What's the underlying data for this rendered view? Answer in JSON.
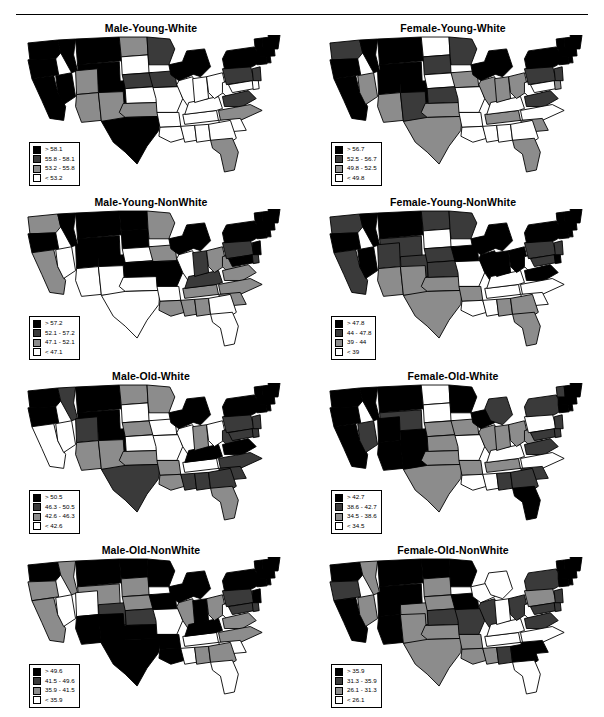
{
  "figure": {
    "has_top_rule": true,
    "panel_count": 8,
    "bin_colors": [
      "#000000",
      "#3a3a3a",
      "#8c8c8c",
      "#ffffff"
    ]
  },
  "chart_data": {
    "type": "map",
    "title": "",
    "subtitle": "",
    "legend_position": "bottom-left inside each panel",
    "class_colors": [
      "#000000",
      "#3a3a3a",
      "#8c8c8c",
      "#ffffff"
    ],
    "panels": [
      {
        "title": "Male-Young-White",
        "legend": [
          {
            "swatch": "#000000",
            "label": "> 58.1"
          },
          {
            "swatch": "#3a3a3a",
            "label": "55.8 - 58.1"
          },
          {
            "swatch": "#8c8c8c",
            "label": "53.2 - 55.8"
          },
          {
            "swatch": "#ffffff",
            "label": "< 53.2"
          }
        ],
        "breaks": [
          53.2,
          55.8,
          58.1
        ],
        "state_classes": {
          "WA": 0,
          "OR": 0,
          "CA": 0,
          "NV": 0,
          "ID": 0,
          "MT": 0,
          "WY": 0,
          "UT": 2,
          "AZ": 2,
          "CO": 0,
          "NM": 2,
          "ND": 2,
          "SD": 3,
          "NE": 1,
          "KS": 3,
          "OK": 2,
          "TX": 0,
          "MN": 1,
          "IA": 1,
          "MO": 3,
          "AR": 3,
          "LA": 3,
          "WI": 0,
          "IL": 3,
          "MS": 3,
          "AL": 3,
          "TN": 3,
          "KY": 3,
          "IN": 3,
          "MI": 0,
          "OH": 3,
          "WV": 3,
          "VA": 1,
          "NC": 2,
          "SC": 3,
          "GA": 3,
          "FL": 2,
          "PA": 1,
          "NY": 0,
          "MD": 3,
          "DE": 3,
          "NJ": 1,
          "CT": 0,
          "RI": 0,
          "MA": 0,
          "VT": 0,
          "NH": 0,
          "ME": 0
        }
      },
      {
        "title": "Female-Young-White",
        "legend": [
          {
            "swatch": "#000000",
            "label": "> 56.7"
          },
          {
            "swatch": "#3a3a3a",
            "label": "52.5 - 56.7"
          },
          {
            "swatch": "#8c8c8c",
            "label": "49.8 - 52.5"
          },
          {
            "swatch": "#ffffff",
            "label": "< 49.8"
          }
        ],
        "breaks": [
          49.8,
          52.5,
          56.7
        ],
        "state_classes": {
          "WA": 1,
          "OR": 0,
          "CA": 0,
          "NV": 2,
          "ID": 0,
          "MT": 0,
          "WY": 0,
          "UT": 0,
          "AZ": 2,
          "CO": 0,
          "NM": 1,
          "ND": 3,
          "SD": 1,
          "NE": 3,
          "KS": 1,
          "OK": 2,
          "TX": 2,
          "MN": 1,
          "IA": 2,
          "MO": 3,
          "AR": 3,
          "LA": 3,
          "WI": 0,
          "IL": 2,
          "MS": 3,
          "AL": 3,
          "TN": 2,
          "KY": 3,
          "IN": 2,
          "MI": 0,
          "OH": 2,
          "WV": 3,
          "VA": 1,
          "NC": 3,
          "SC": 2,
          "GA": 3,
          "FL": 2,
          "PA": 1,
          "NY": 0,
          "MD": 3,
          "DE": 2,
          "NJ": 1,
          "CT": 0,
          "RI": 0,
          "MA": 0,
          "VT": 0,
          "NH": 0,
          "ME": 0
        }
      },
      {
        "title": "Male-Young-NonWhite",
        "legend": [
          {
            "swatch": "#000000",
            "label": "> 57.2"
          },
          {
            "swatch": "#3a3a3a",
            "label": "52.1 - 57.2"
          },
          {
            "swatch": "#8c8c8c",
            "label": "47.1 - 52.1"
          },
          {
            "swatch": "#ffffff",
            "label": "< 47.1"
          }
        ],
        "breaks": [
          47.1,
          52.1,
          57.2
        ],
        "state_classes": {
          "WA": 2,
          "OR": 0,
          "CA": 2,
          "NV": 3,
          "ID": 0,
          "MT": 0,
          "WY": 0,
          "UT": 0,
          "AZ": 3,
          "CO": 0,
          "NM": 3,
          "ND": 0,
          "SD": 0,
          "NE": 3,
          "KS": 0,
          "OK": 3,
          "TX": 3,
          "MN": 2,
          "IA": 2,
          "MO": 0,
          "AR": 3,
          "LA": 2,
          "WI": 0,
          "IL": 3,
          "MS": 2,
          "AL": 2,
          "TN": 2,
          "KY": 1,
          "IN": 1,
          "MI": 0,
          "OH": 2,
          "WV": 2,
          "VA": 2,
          "NC": 2,
          "SC": 2,
          "GA": 3,
          "FL": 3,
          "PA": 1,
          "NY": 0,
          "MD": 0,
          "DE": 1,
          "NJ": 0,
          "CT": 0,
          "RI": 0,
          "MA": 0,
          "VT": 0,
          "NH": 0,
          "ME": 0
        }
      },
      {
        "title": "Female-Young-NonWhite",
        "legend": [
          {
            "swatch": "#000000",
            "label": "> 47.8"
          },
          {
            "swatch": "#3a3a3a",
            "label": "44 - 47.8"
          },
          {
            "swatch": "#8c8c8c",
            "label": "39 - 44"
          },
          {
            "swatch": "#ffffff",
            "label": "< 39"
          }
        ],
        "breaks": [
          39,
          44,
          47.8
        ],
        "state_classes": {
          "WA": 1,
          "OR": 0,
          "CA": 1,
          "NV": 0,
          "ID": 0,
          "MT": 0,
          "WY": 1,
          "UT": 1,
          "AZ": 2,
          "CO": 1,
          "NM": 2,
          "ND": 1,
          "SD": 3,
          "NE": 1,
          "KS": 1,
          "OK": 2,
          "TX": 2,
          "MN": 1,
          "IA": 0,
          "MO": 3,
          "AR": 2,
          "LA": 3,
          "WI": 0,
          "IL": 0,
          "MS": 3,
          "AL": 2,
          "TN": 3,
          "KY": 3,
          "IN": 0,
          "MI": 0,
          "OH": 0,
          "WV": 3,
          "VA": 0,
          "NC": 3,
          "SC": 3,
          "GA": 2,
          "FL": 2,
          "PA": 1,
          "NY": 0,
          "MD": 1,
          "DE": 0,
          "NJ": 1,
          "CT": 0,
          "RI": 0,
          "MA": 0,
          "VT": 0,
          "NH": 0,
          "ME": 0
        }
      },
      {
        "title": "Male-Old-White",
        "legend": [
          {
            "swatch": "#000000",
            "label": "> 50.5"
          },
          {
            "swatch": "#3a3a3a",
            "label": "46.3 - 50.5"
          },
          {
            "swatch": "#8c8c8c",
            "label": "42.6 - 46.3"
          },
          {
            "swatch": "#ffffff",
            "label": "< 42.6"
          }
        ],
        "breaks": [
          42.6,
          46.3,
          50.5
        ],
        "state_classes": {
          "WA": 0,
          "OR": 0,
          "CA": 3,
          "NV": 3,
          "ID": 1,
          "MT": 0,
          "WY": 0,
          "UT": 1,
          "AZ": 2,
          "CO": 0,
          "NM": 2,
          "ND": 2,
          "SD": 3,
          "NE": 2,
          "KS": 3,
          "OK": 2,
          "TX": 1,
          "MN": 2,
          "IA": 3,
          "MO": 3,
          "AR": 2,
          "LA": 2,
          "WI": 0,
          "IL": 3,
          "MS": 1,
          "AL": 1,
          "TN": 3,
          "KY": 0,
          "IN": 2,
          "MI": 0,
          "OH": 3,
          "WV": 1,
          "VA": 0,
          "NC": 1,
          "SC": 1,
          "GA": 1,
          "FL": 2,
          "PA": 1,
          "NY": 0,
          "MD": 1,
          "DE": 1,
          "NJ": 1,
          "CT": 0,
          "RI": 0,
          "MA": 0,
          "VT": 0,
          "NH": 0,
          "ME": 0
        }
      },
      {
        "title": "Female-Old-White",
        "legend": [
          {
            "swatch": "#000000",
            "label": "> 42.7"
          },
          {
            "swatch": "#3a3a3a",
            "label": "38.6 - 42.7"
          },
          {
            "swatch": "#8c8c8c",
            "label": "34.5 - 38.6"
          },
          {
            "swatch": "#ffffff",
            "label": "< 34.5"
          }
        ],
        "breaks": [
          34.5,
          38.6,
          42.7
        ],
        "state_classes": {
          "WA": 0,
          "OR": 0,
          "CA": 0,
          "NV": 1,
          "ID": 0,
          "MT": 0,
          "WY": 1,
          "UT": 0,
          "AZ": 0,
          "CO": 0,
          "NM": 0,
          "ND": 3,
          "SD": 3,
          "NE": 2,
          "KS": 2,
          "OK": 2,
          "TX": 2,
          "MN": 0,
          "IA": 2,
          "MO": 3,
          "AR": 2,
          "LA": 3,
          "WI": 0,
          "IL": 2,
          "MS": 3,
          "AL": 1,
          "TN": 2,
          "KY": 3,
          "IN": 2,
          "MI": 1,
          "OH": 2,
          "WV": 2,
          "VA": 1,
          "NC": 3,
          "SC": 1,
          "GA": 1,
          "FL": 0,
          "PA": 3,
          "NY": 1,
          "MD": 1,
          "DE": 1,
          "NJ": 1,
          "CT": 0,
          "RI": 0,
          "MA": 0,
          "VT": 1,
          "NH": 0,
          "ME": 0
        }
      },
      {
        "title": "Male-Old-NonWhite",
        "legend": [
          {
            "swatch": "#000000",
            "label": "> 49.6"
          },
          {
            "swatch": "#3a3a3a",
            "label": "41.5 - 49.6"
          },
          {
            "swatch": "#8c8c8c",
            "label": "35.9 - 41.5"
          },
          {
            "swatch": "#ffffff",
            "label": "< 35.9"
          }
        ],
        "breaks": [
          35.9,
          41.5,
          49.6
        ],
        "state_classes": {
          "WA": 0,
          "OR": 2,
          "CA": 2,
          "NV": 3,
          "ID": 2,
          "MT": 0,
          "WY": 2,
          "UT": 3,
          "AZ": 0,
          "CO": 1,
          "NM": 0,
          "ND": 0,
          "SD": 2,
          "NE": 2,
          "KS": 1,
          "OK": 0,
          "TX": 0,
          "MN": 0,
          "IA": 0,
          "MO": 3,
          "AR": 0,
          "LA": 0,
          "WI": 0,
          "IL": 2,
          "MS": 3,
          "AL": 2,
          "TN": 3,
          "KY": 0,
          "IN": 0,
          "MI": 0,
          "OH": 2,
          "WV": 3,
          "VA": 2,
          "NC": 2,
          "SC": 3,
          "GA": 2,
          "FL": 3,
          "PA": 1,
          "NY": 0,
          "MD": 1,
          "DE": 1,
          "NJ": 0,
          "CT": 0,
          "RI": 0,
          "MA": 0,
          "VT": 0,
          "NH": 0,
          "ME": 0
        }
      },
      {
        "title": "Female-Old-NonWhite",
        "legend": [
          {
            "swatch": "#000000",
            "label": "> 35.9"
          },
          {
            "swatch": "#3a3a3a",
            "label": "31.3 - 35.9"
          },
          {
            "swatch": "#8c8c8c",
            "label": "26.1 - 31.3"
          },
          {
            "swatch": "#ffffff",
            "label": "< 26.1"
          }
        ],
        "breaks": [
          26.1,
          31.3,
          35.9
        ],
        "state_classes": {
          "WA": 0,
          "OR": 1,
          "CA": 0,
          "NV": 2,
          "ID": 2,
          "MT": 0,
          "WY": 0,
          "UT": 0,
          "AZ": 0,
          "CO": 2,
          "NM": 2,
          "ND": 0,
          "SD": 2,
          "NE": 2,
          "KS": 1,
          "OK": 2,
          "TX": 2,
          "MN": 0,
          "IA": 0,
          "MO": 1,
          "AR": 2,
          "LA": 2,
          "WI": 3,
          "IL": 1,
          "MS": 2,
          "AL": 1,
          "TN": 3,
          "KY": 3,
          "IN": 3,
          "MI": 3,
          "OH": 1,
          "WV": 3,
          "VA": 1,
          "NC": 3,
          "SC": 0,
          "GA": 0,
          "FL": 3,
          "PA": 2,
          "NY": 1,
          "MD": 1,
          "DE": 1,
          "NJ": 1,
          "CT": 0,
          "RI": 0,
          "MA": 0,
          "VT": 0,
          "NH": 0,
          "ME": 0
        }
      }
    ]
  }
}
